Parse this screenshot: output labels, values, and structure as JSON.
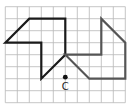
{
  "diagram": {
    "type": "grid-rotation",
    "grid": {
      "columns": 10,
      "rows": 8
    },
    "colors": {
      "grid": "#b8b8b8",
      "original": "#1a1a1a",
      "image": "#555555",
      "point": "#111111"
    },
    "shapes": [
      {
        "name": "original-shape",
        "role": "original",
        "vertices": [
          [
            0,
            3
          ],
          [
            2,
            1
          ],
          [
            5,
            1
          ],
          [
            5,
            4
          ],
          [
            3,
            6
          ],
          [
            3,
            3
          ]
        ]
      },
      {
        "name": "rotated-shape",
        "role": "image",
        "vertices": [
          [
            5,
            4
          ],
          [
            8,
            4
          ],
          [
            8,
            1
          ],
          [
            10,
            3
          ],
          [
            10,
            6
          ],
          [
            7,
            6
          ]
        ]
      }
    ],
    "point": {
      "label": "C",
      "at": [
        5,
        6
      ]
    }
  }
}
